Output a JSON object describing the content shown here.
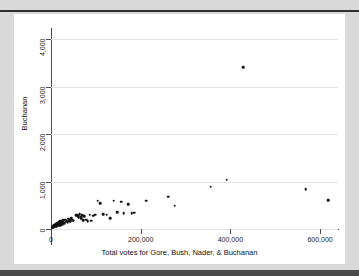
{
  "figure": {
    "background": "#ffffff",
    "page_background": "#d9d9d9",
    "marker_color": "#111111",
    "grid_color": "#e3e3e3",
    "axis_color": "#4d4d4d"
  },
  "chart_data": {
    "type": "scatter",
    "title": "",
    "xlabel": "Total votes for Gore, Bush, Nader, & Buchanan",
    "ylabel": "Buchanan",
    "xlim": [
      0,
      640000
    ],
    "ylim": [
      0,
      4200
    ],
    "xticks": [
      0,
      200000,
      400000,
      600000
    ],
    "xticklabels": [
      "0",
      "200,000",
      "400,000",
      "600,000"
    ],
    "yticks": [
      0,
      1000,
      2000,
      3000,
      4000
    ],
    "yticklabels": [
      "0",
      "1,000",
      "2,000",
      "3,000",
      "4,000"
    ],
    "grid": "horizontal",
    "legend": "none",
    "series": [
      {
        "name": "Florida counties",
        "points": [
          [
            2500,
            30
          ],
          [
            3800,
            45
          ],
          [
            4200,
            25
          ],
          [
            5100,
            60
          ],
          [
            5600,
            40
          ],
          [
            6300,
            70
          ],
          [
            7100,
            55
          ],
          [
            7800,
            90
          ],
          [
            8400,
            65
          ],
          [
            9200,
            80
          ],
          [
            9900,
            50
          ],
          [
            10500,
            105
          ],
          [
            11200,
            75
          ],
          [
            12000,
            95
          ],
          [
            12800,
            60
          ],
          [
            13500,
            120
          ],
          [
            14300,
            85
          ],
          [
            15000,
            110
          ],
          [
            15800,
            70
          ],
          [
            16500,
            135
          ],
          [
            17200,
            100
          ],
          [
            18000,
            90
          ],
          [
            18800,
            150
          ],
          [
            19500,
            115
          ],
          [
            20300,
            80
          ],
          [
            21000,
            160
          ],
          [
            22000,
            125
          ],
          [
            23000,
            105
          ],
          [
            24000,
            175
          ],
          [
            25000,
            140
          ],
          [
            26000,
            95
          ],
          [
            27500,
            185
          ],
          [
            28500,
            130
          ],
          [
            30000,
            120
          ],
          [
            31500,
            200
          ],
          [
            33000,
            155
          ],
          [
            35000,
            170
          ],
          [
            37000,
            145
          ],
          [
            39000,
            215
          ],
          [
            41000,
            180
          ],
          [
            43000,
            160
          ],
          [
            45000,
            230
          ],
          [
            47000,
            195
          ],
          [
            49000,
            175
          ],
          [
            56000,
            285
          ],
          [
            58000,
            300
          ],
          [
            60000,
            270
          ],
          [
            62000,
            240
          ],
          [
            64000,
            310
          ],
          [
            66000,
            255
          ],
          [
            68000,
            225
          ],
          [
            70000,
            290
          ],
          [
            72000,
            180
          ],
          [
            74000,
            265
          ],
          [
            78000,
            195
          ],
          [
            82000,
            160
          ],
          [
            86000,
            300
          ],
          [
            90000,
            175
          ],
          [
            94000,
            280
          ],
          [
            98000,
            305
          ],
          [
            104000,
            600
          ],
          [
            110000,
            540
          ],
          [
            116000,
            310
          ],
          [
            124000,
            300
          ],
          [
            132000,
            230
          ],
          [
            140000,
            600
          ],
          [
            148000,
            350
          ],
          [
            156000,
            580
          ],
          [
            162000,
            330
          ],
          [
            172000,
            520
          ],
          [
            180000,
            330
          ],
          [
            186000,
            340
          ],
          [
            212000,
            600
          ],
          [
            262000,
            680
          ],
          [
            276000,
            490
          ],
          [
            356000,
            890
          ],
          [
            392000,
            1040
          ],
          [
            428000,
            3410
          ],
          [
            568000,
            840
          ],
          [
            618000,
            610
          ]
        ]
      }
    ],
    "annotations": []
  }
}
